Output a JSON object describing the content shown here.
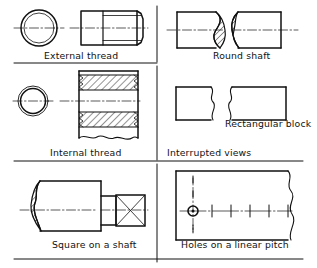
{
  "sheet": {
    "title": "Conventional representation of engineering features",
    "background_color": "#ffffff",
    "line_color": "#111111",
    "width": 317,
    "height": 268
  },
  "panels": [
    {
      "id": "external-thread",
      "label": "External thread",
      "column": "left",
      "row": 1,
      "views": [
        "end view: two concentric circles",
        "side view: rectangle with thread lines and chamfered end"
      ]
    },
    {
      "id": "round-shaft",
      "label": "Round shaft",
      "column": "right",
      "row": 1,
      "views": [
        "interrupted view with S-shaped hatched break"
      ]
    },
    {
      "id": "internal-thread",
      "label": "Internal thread",
      "column": "left",
      "row": 2,
      "views": [
        "end view: two concentric circles",
        "sectioned view with hatching and wavy break"
      ]
    },
    {
      "id": "rectangular-block",
      "label": "Rectangular block",
      "column": "right",
      "row": 2,
      "views": [
        "two rectangles with freehand wavy break edges"
      ]
    },
    {
      "id": "interrupted-views",
      "label": "Interrupted views",
      "column": "right",
      "row": 2,
      "kind": "section-heading"
    },
    {
      "id": "square-on-shaft",
      "label": "Square on a shaft",
      "column": "left",
      "row": 3,
      "views": [
        "shaft with hatched break and square section marked with diagonals"
      ]
    },
    {
      "id": "holes-on-linear-pitch",
      "label": "Holes on a linear pitch",
      "column": "right",
      "row": 3,
      "views": [
        "plate with one drawn hole and centre-line cross marks for repeated holes"
      ],
      "hole_count_marks": 6
    }
  ],
  "captions": {
    "external_thread": "External thread",
    "round_shaft": "Round shaft",
    "internal_thread": "Internal thread",
    "rectangular_block": "Rectangular block",
    "interrupted_views": "Interrupted views",
    "square_on_a_shaft": "Square on a shaft",
    "holes_on_a_linear_pitch": "Holes on a linear pitch"
  }
}
